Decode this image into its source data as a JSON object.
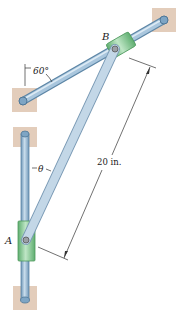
{
  "labels": {
    "point_a": "A",
    "point_b": "B",
    "angle_rod": "60°",
    "angle_theta": "θ",
    "length": "20 in."
  },
  "colors": {
    "rod": "#8fb3cf",
    "rod_edge": "#5d86a6",
    "collar": "#8fcf9a",
    "collar_edge": "#4f9a5e",
    "link": "#b9d0e2",
    "link_edge": "#7a9ab5",
    "wall": "#e3cdbb"
  }
}
